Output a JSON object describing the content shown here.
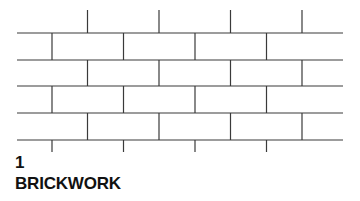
{
  "figure": {
    "caption_number": "1",
    "caption_title": "BRICKWORK",
    "background_color": "#ffffff",
    "line_color": "#3a3a3a",
    "text_color": "#111111"
  },
  "diagram": {
    "name": "running-bond-brick-wall-elevation",
    "type": "line-drawing",
    "width": 360,
    "height": 160,
    "bed_joint_x_start": 17,
    "bed_joint_x_end": 343,
    "bed_joint_y": [
      33,
      60,
      86,
      113,
      140
    ],
    "head_joint_spacing": 71.5,
    "head_joint_x_odd": [
      52,
      123.5,
      195,
      266.5
    ],
    "head_joint_x_even": [
      87.5,
      159,
      230.5,
      302
    ],
    "top_stub_x": [
      87.5,
      159,
      230.5,
      302
    ],
    "top_stub_y_start": 10,
    "top_stub_y_end": 33,
    "bottom_stub_x": [
      52,
      123.5,
      195,
      266.5
    ],
    "bottom_stub_y_start": 140,
    "bottom_stub_y_end": 152,
    "course_head_joint_phase": [
      "odd",
      "even",
      "odd",
      "even",
      "odd"
    ],
    "line_width": 1.2
  }
}
